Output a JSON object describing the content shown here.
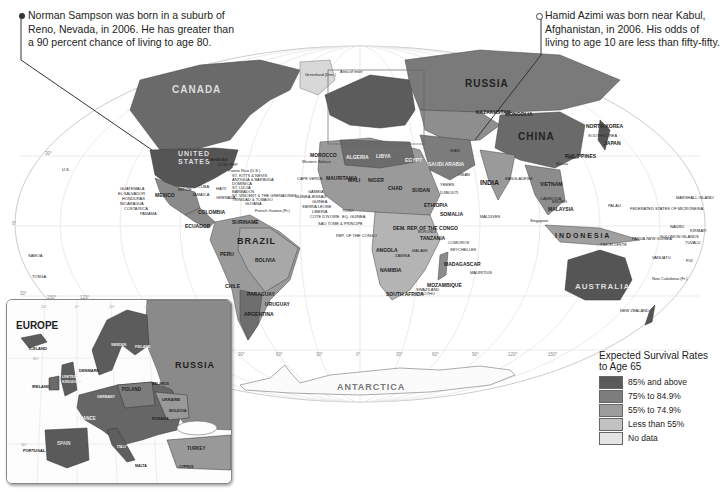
{
  "callouts": {
    "left": {
      "text": "Norman Sampson was born in a suburb of Reno, Nevada, in 2006. He has greater than a 90 percent chance of living to age 80.",
      "lines": [
        "Norman Sampson was born in a suburb of",
        "Reno, Nevada, in 2006. He has greater than",
        "a 90 percent chance of living to age 80."
      ]
    },
    "right": {
      "text": "Hamid Azimi was born near Kabul, Afghanistan, in 2006. His odds of living to age 10 are less than fifty-fifty.",
      "lines": [
        "Hamid Azimi was born near Kabul,",
        "Afghanistan, in 2006. His odds of",
        "living to age 10 are less than fifty-fifty."
      ]
    }
  },
  "legend": {
    "title": "Expected Survival Rates to Age 65",
    "title_lines": [
      "Expected  Survival Rates",
      "to Age 65"
    ],
    "items": [
      {
        "label": "85% and above",
        "color": "#5a5a5a"
      },
      {
        "label": "75% to 84.9%",
        "color": "#7d7d7d"
      },
      {
        "label": "55% to 74.9%",
        "color": "#9d9d9d"
      },
      {
        "label": "Less than 55%",
        "color": "#c2c2c2"
      },
      {
        "label": "No data",
        "color": "#e4e4e4"
      }
    ]
  },
  "map": {
    "continent_labels": {
      "antarctica": "ANTARCTICA",
      "australia": "AUSTRALIA",
      "indonesia": "I N D O N E S I A"
    },
    "country_labels": {
      "canada": "CANADA",
      "united_states_1": "UNITED",
      "united_states_2": "STATES",
      "russia": "RUSSIA",
      "china": "CHINA",
      "brazil": "BRAZIL",
      "india": "INDIA",
      "mexico": "MEXICO",
      "algeria": "ALGERIA",
      "libya": "LIBYA",
      "egypt": "EGYPT",
      "mali": "MALI",
      "niger": "NIGER",
      "chad": "CHAD",
      "sudan": "SUDAN",
      "ethiopia": "ETHIOPIA",
      "mauritania": "MAURITANIA",
      "morocco": "MOROCCO",
      "angola": "ANGOLA",
      "namibia": "NAMIBIA",
      "tanzania": "TANZANIA",
      "madagascar": "MADAGASCAR",
      "mozambique": "MOZAMBIQUE",
      "south_africa": "SOUTH AFRICA",
      "dem_rep_congo": "DEM. REP. OF THE CONGO",
      "somalia": "SOMALIA",
      "peru": "PERU",
      "bolivia": "BOLIVIA",
      "chile": "CHILE",
      "argentina": "ARGENTINA",
      "paraguay": "PARAGUAY",
      "uruguay": "URUGUAY",
      "colombia": "COLOMBIA",
      "venezuela": "VENEZUELA",
      "ecuador": "ECUADOR",
      "suriname": "SURINAME",
      "guyana": "GUYANA",
      "french_guiana": "French Guiana (Fr.)",
      "kazakhstan": "KAZAKHSTAN",
      "mongolia": "MONGOLIA",
      "saudi_arabia": "SAUDI ARABIA",
      "iran": "IRAN",
      "oman": "OMAN",
      "yemen": "YEMEN",
      "djibouti": "DJIBOUTI",
      "north_korea": "NORTH KOREA",
      "south_korea": "SOUTH KOREA",
      "japan": "JAPAN",
      "philippines": "PHILIPPINES",
      "vietnam": "VIETNAM",
      "cambodia": "CAMBODIA",
      "malaysia": "MALAYSIA",
      "brunei": "BRUNEI",
      "bangladesh": "BANGLADESH",
      "greenland": "Greenland (Den.)",
      "area_of_inset": "Area of inset",
      "western_sahara": "Western Sahara",
      "cape_verde": "CAPE VERDE",
      "gambia": "GAMBIA",
      "guinea": "GUINEA",
      "guinea_bissau": "GUINEA-BISSAU",
      "sierra_leone": "SIERRA LEONE",
      "liberia": "LIBERIA",
      "cote_divoire": "COTE D'IVOIRE",
      "togo": "TOGO",
      "eq_guinea": "EQ. GUINEA",
      "sao_tome": "SAO TOME & PRINCIPE",
      "rep_congo": "REP. OF THE CONGO",
      "burundi": "BURUNDI",
      "comoros": "COMOROS",
      "seychelles": "SEYCHELLES",
      "mauritius": "MAURITIUS",
      "maldives": "MALDIVES",
      "swaziland": "SWAZILAND",
      "lesotho": "LESOTHO",
      "zambia": "ZAMBIA",
      "malawi": "MALAWI",
      "guatemala": "GUATEMALA",
      "el_salvador": "EL SALVADOR",
      "honduras": "HONDURAS",
      "nicaragua": "NICARAGUA",
      "costa_rica": "COSTA RICA",
      "panama": "PANAMA",
      "belize": "BELIZE",
      "cuba": "CUBA",
      "jamaica": "JAMAICA",
      "haiti": "HAITI",
      "dom_rep": "DOM. REP.",
      "bahamas": "BAHAMAS",
      "puerto_rico": "Puerto Rico (U.S.)",
      "st_kitts": "ST. KITTS & NEVIS",
      "antigua": "ANTIGUA & BARBUDA",
      "dominica": "DOMINICA",
      "st_lucia": "ST. LUCIA",
      "barbados": "BARBADOS",
      "st_vincent": "ST. VINCENT & THE GRENADINES",
      "grenada": "GRENADA",
      "trinidad": "TRINIDAD & TOBAGO",
      "us_hawaii": "U.S.",
      "samoa": "SAMOA",
      "tonga": "TONGA",
      "palau": "PALAU",
      "micronesia": "FEDERATED STATES OF MICRONESIA",
      "marshall": "MARSHALL ISLANDS",
      "nauru": "NAURU",
      "kiribati": "KIRIBATI",
      "tuvalu": "TUVALU",
      "png": "PAPUA NEW GUINEA",
      "solomon": "SOLOMON ISLANDS",
      "vanuatu": "VANUATU",
      "fiji": "FIJI",
      "new_caledonia": "New Caledonia (Fr.)",
      "new_zealand": "NEW ZEALAND",
      "timor_leste": "TIMOR-LESTE",
      "taiwan": "Taiwan",
      "macau": "Macau",
      "singapore": "Singapore"
    },
    "graticule_labels": [
      "150°",
      "120°",
      "90°",
      "60°",
      "30°",
      "0°",
      "30°",
      "60°",
      "90°",
      "120°",
      "150°"
    ],
    "lat_labels": [
      "30°",
      "0°",
      "30°"
    ]
  },
  "inset": {
    "title": "EUROPE",
    "labels": {
      "russia": "RUSSIA",
      "iceland": "ICELAND",
      "ireland": "IRELAND",
      "uk_1": "UNITED",
      "uk_2": "KINGDOM",
      "denmark": "DENMARK",
      "poland": "POLAND",
      "ukraine": "UKRAINE",
      "moldova": "MOLDOVA",
      "france": "FRANCE",
      "spain": "SPAIN",
      "portugal": "PORTUGAL",
      "italy": "ITALY",
      "turkey": "TURKEY",
      "malta": "MALTA",
      "cyprus": "CYPRUS",
      "sweden": "SWEDEN",
      "finland": "FINLAND",
      "germany": "GERMANY",
      "belarus": "BELARUS",
      "romania": "ROMANIA"
    },
    "graticule_labels": [
      "20°",
      "0°",
      "20°",
      "40°"
    ],
    "lat_labels": [
      "60°",
      "40°"
    ]
  }
}
